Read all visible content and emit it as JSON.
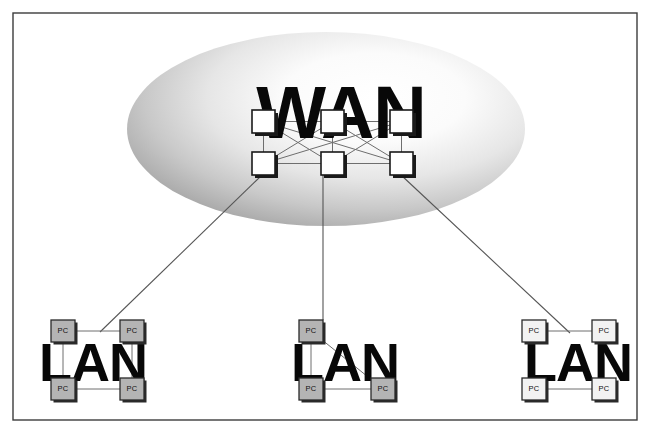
{
  "diagram": {
    "type": "network-topology",
    "canvas": {
      "width": 650,
      "height": 433
    },
    "background_color": "#ffffff",
    "frame": {
      "label": "diagram-frame",
      "x": 13,
      "y": 13,
      "width": 624,
      "height": 407,
      "stroke_color": "#3c3c3c"
    },
    "wan": {
      "label": "WAN",
      "cloud": {
        "label": "wan-cloud",
        "center_x": 326,
        "center_y": 129,
        "radius_x": 199,
        "radius_y": 97,
        "gradient_inner_color": "#ffffff",
        "gradient_outer_color": "#a6a6a6"
      },
      "text_x": 341,
      "text_y": 138,
      "routers": [
        {
          "name": "wan-router-1",
          "x": 252,
          "y": 110,
          "size": 23
        },
        {
          "name": "wan-router-2",
          "x": 321,
          "y": 110,
          "size": 23
        },
        {
          "name": "wan-router-3",
          "x": 390,
          "y": 110,
          "size": 23
        },
        {
          "name": "wan-router-4",
          "x": 252,
          "y": 152,
          "size": 23
        },
        {
          "name": "wan-router-5",
          "x": 321,
          "y": 152,
          "size": 23
        },
        {
          "name": "wan-router-6",
          "x": 390,
          "y": 152,
          "size": 23
        }
      ],
      "mesh_links": [
        [
          0,
          1
        ],
        [
          1,
          2
        ],
        [
          3,
          4
        ],
        [
          4,
          5
        ],
        [
          0,
          3
        ],
        [
          1,
          4
        ],
        [
          2,
          5
        ],
        [
          0,
          4
        ],
        [
          0,
          5
        ],
        [
          1,
          3
        ],
        [
          1,
          5
        ],
        [
          2,
          3
        ],
        [
          2,
          4
        ]
      ]
    },
    "lans": [
      {
        "name": "lan-left",
        "label": "LAN",
        "text_x": 93,
        "text_y": 381,
        "pc_style": "gray",
        "pcs": [
          {
            "name": "lan-left-pc-1",
            "label": "PC",
            "x": 51,
            "y": 320,
            "width": 24,
            "height": 22
          },
          {
            "name": "lan-left-pc-2",
            "label": "PC",
            "x": 120,
            "y": 320,
            "width": 24,
            "height": 22
          },
          {
            "name": "lan-left-pc-3",
            "label": "PC",
            "x": 51,
            "y": 378,
            "width": 24,
            "height": 22
          },
          {
            "name": "lan-left-pc-4",
            "label": "PC",
            "x": 120,
            "y": 378,
            "width": 24,
            "height": 22
          }
        ],
        "links": [
          [
            0,
            1
          ],
          [
            0,
            2
          ],
          [
            1,
            3
          ],
          [
            2,
            3
          ]
        ],
        "uplink_point": {
          "x": 100,
          "y": 332
        }
      },
      {
        "name": "lan-middle",
        "label": "LAN",
        "text_x": 345,
        "text_y": 381,
        "pc_style": "gray",
        "pcs": [
          {
            "name": "lan-middle-pc-1",
            "label": "PC",
            "x": 299,
            "y": 320,
            "width": 24,
            "height": 22
          },
          {
            "name": "lan-middle-pc-2",
            "label": "PC",
            "x": 299,
            "y": 378,
            "width": 24,
            "height": 22
          },
          {
            "name": "lan-middle-pc-3",
            "label": "PC",
            "x": 371,
            "y": 378,
            "width": 24,
            "height": 22
          }
        ],
        "links": [
          [
            0,
            1
          ],
          [
            1,
            2
          ],
          [
            0,
            2
          ]
        ],
        "uplink_point": {
          "x": 323,
          "y": 320
        }
      },
      {
        "name": "lan-right",
        "label": "LAN",
        "text_x": 578,
        "text_y": 381,
        "pc_style": "light",
        "pcs": [
          {
            "name": "lan-right-pc-1",
            "label": "PC",
            "x": 522,
            "y": 320,
            "width": 24,
            "height": 22
          },
          {
            "name": "lan-right-pc-2",
            "label": "PC",
            "x": 592,
            "y": 320,
            "width": 24,
            "height": 22
          },
          {
            "name": "lan-right-pc-3",
            "label": "PC",
            "x": 522,
            "y": 378,
            "width": 24,
            "height": 22
          },
          {
            "name": "lan-right-pc-4",
            "label": "PC",
            "x": 592,
            "y": 378,
            "width": 24,
            "height": 22
          }
        ],
        "links": [
          [
            0,
            1
          ],
          [
            0,
            2
          ],
          [
            1,
            3
          ],
          [
            2,
            3
          ]
        ],
        "uplink_point": {
          "x": 570,
          "y": 333
        }
      }
    ],
    "wan_to_lan_links": [
      {
        "name": "uplink-left",
        "from_x": 262,
        "from_y": 175,
        "to_x": 100,
        "to_y": 332
      },
      {
        "name": "uplink-middle",
        "from_x": 323,
        "from_y": 175,
        "to_x": 323,
        "to_y": 320
      },
      {
        "name": "uplink-right",
        "from_x": 401,
        "from_y": 175,
        "to_x": 570,
        "to_y": 333
      }
    ]
  }
}
